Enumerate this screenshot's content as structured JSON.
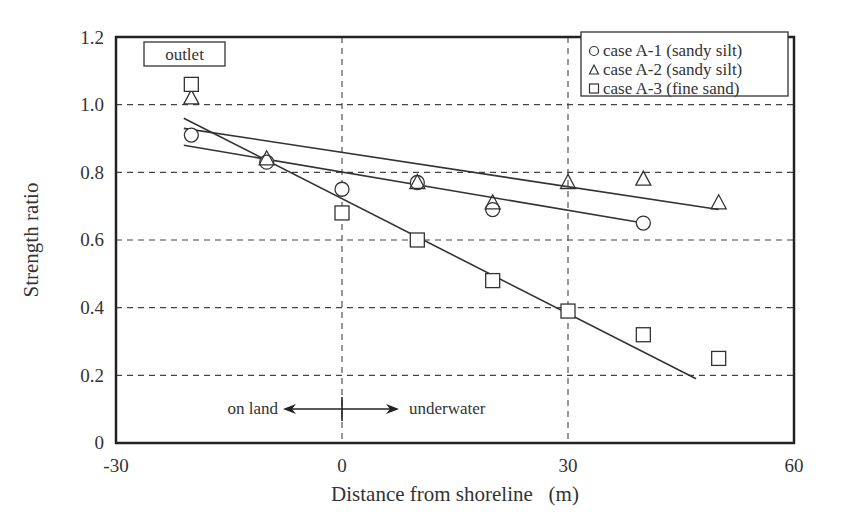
{
  "chart_data": {
    "type": "scatter",
    "title": "",
    "xlabel": "Distance from shoreline   (m)",
    "ylabel": "Strength ratio",
    "xlim": [
      -30,
      60
    ],
    "ylim": [
      0,
      1.2
    ],
    "xticks": [
      -30,
      0,
      30,
      60
    ],
    "xtick_labels": [
      "-30",
      "0",
      "30",
      "60"
    ],
    "yticks": [
      0,
      0.2,
      0.4,
      0.6,
      0.8,
      1.0,
      1.2
    ],
    "ytick_labels": [
      "0",
      "0.2",
      "0.4",
      "0.6",
      "0.8",
      "1.0",
      "1.2"
    ],
    "grid": {
      "x": [
        0,
        30
      ],
      "y": [
        0.2,
        0.4,
        0.6,
        0.8,
        1.0
      ],
      "style": "dashed"
    },
    "legend_position": "upper right",
    "series": [
      {
        "name": "case A-1 (sandy silt)",
        "marker": "circle",
        "points": [
          [
            -20,
            0.91
          ],
          [
            -10,
            0.83
          ],
          [
            0,
            0.75
          ],
          [
            10,
            0.77
          ],
          [
            20,
            0.69
          ],
          [
            40,
            0.65
          ]
        ],
        "fit_line": [
          [
            -21,
            0.88
          ],
          [
            40,
            0.65
          ]
        ]
      },
      {
        "name": "case A-2 (sandy silt)",
        "marker": "triangle",
        "points": [
          [
            -20,
            1.02
          ],
          [
            -10,
            0.84
          ],
          [
            10,
            0.77
          ],
          [
            20,
            0.71
          ],
          [
            30,
            0.77
          ],
          [
            40,
            0.78
          ],
          [
            50,
            0.71
          ]
        ],
        "fit_line": [
          [
            -21,
            0.93
          ],
          [
            50,
            0.69
          ]
        ]
      },
      {
        "name": "case A-3 (fine sand)",
        "marker": "square",
        "points": [
          [
            -20,
            1.06
          ],
          [
            0,
            0.68
          ],
          [
            10,
            0.6
          ],
          [
            20,
            0.48
          ],
          [
            30,
            0.39
          ],
          [
            40,
            0.32
          ],
          [
            50,
            0.25
          ]
        ],
        "fit_line": [
          [
            -21,
            0.96
          ],
          [
            47,
            0.19
          ]
        ]
      }
    ],
    "annotations": [
      {
        "text": "outlet",
        "boxed": true,
        "x": -20,
        "y": 1.16
      },
      {
        "text": "on land",
        "arrow": "left",
        "x": -10,
        "y": 0.18
      },
      {
        "text": "underwater",
        "arrow": "right",
        "x": 10,
        "y": 0.18
      }
    ]
  },
  "legend": {
    "items": [
      {
        "symbol": "○",
        "label": "case A-1 (sandy silt)"
      },
      {
        "symbol": "△",
        "label": "case A-2 (sandy silt)"
      },
      {
        "symbol": "□",
        "label": "case A-3 (fine sand)"
      }
    ]
  },
  "labels": {
    "outlet": "outlet",
    "on_land": "on land",
    "underwater": "underwater",
    "xlabel": "Distance from shoreline   (m)",
    "ylabel": "Strength ratio"
  },
  "ticks": {
    "x": [
      "-30",
      "0",
      "30",
      "60"
    ],
    "y": [
      "0",
      "0.2",
      "0.4",
      "0.6",
      "0.8",
      "1.0",
      "1.2"
    ]
  }
}
